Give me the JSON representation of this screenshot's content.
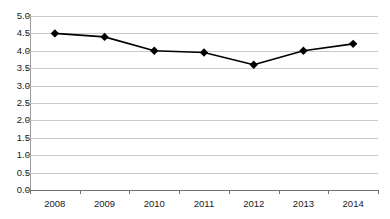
{
  "chart_data": {
    "type": "line",
    "title": "",
    "subtitle": "",
    "xlabel": "",
    "ylabel": "",
    "categories": [
      "2008",
      "2009",
      "2010",
      "2011",
      "2012",
      "2013",
      "2014"
    ],
    "values": [
      4.5,
      4.4,
      4.0,
      3.95,
      3.6,
      4.0,
      4.2
    ],
    "series": [
      {
        "name": "",
        "values": [
          4.5,
          4.4,
          4.0,
          3.95,
          3.6,
          4.0,
          4.2
        ]
      }
    ],
    "ylim": [
      0.0,
      5.0
    ],
    "ytick_values": [
      5.0,
      4.5,
      4.0,
      3.5,
      3.0,
      2.5,
      2.0,
      1.5,
      1.0,
      0.5,
      0.0
    ],
    "ytick_labels": [
      "5.0",
      "4.5",
      "4.0",
      "3.5",
      "3.0",
      "2.5",
      "2.0",
      "1.5",
      "1.0",
      "0.5",
      "0.0"
    ],
    "grid": true,
    "grid_axis": "y",
    "legend": false,
    "legend_position": "none",
    "marker": "diamond",
    "marker_color": "#000000",
    "line_color": "#000000",
    "gridline_color": "#c9c9c9",
    "axis_color": "#6f6f6f",
    "background_color": "#ffffff",
    "annotations": []
  }
}
